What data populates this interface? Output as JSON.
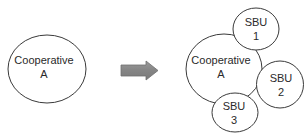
{
  "diagram": {
    "type": "transformation",
    "before": {
      "label_line1": "Cooperative",
      "label_line2": "A"
    },
    "arrow": {
      "direction": "right",
      "color": "#8a8a8a",
      "outline": "#6e6e6e"
    },
    "after": {
      "core": {
        "label_line1": "Cooperative",
        "label_line2": "A"
      },
      "units": [
        {
          "label_line1": "SBU",
          "label_line2": "1"
        },
        {
          "label_line1": "SBU",
          "label_line2": "2"
        },
        {
          "label_line1": "SBU",
          "label_line2": "3"
        }
      ]
    },
    "colors": {
      "stroke": "#3a3a3a",
      "text": "#2a2a2a",
      "background": "#ffffff"
    }
  }
}
